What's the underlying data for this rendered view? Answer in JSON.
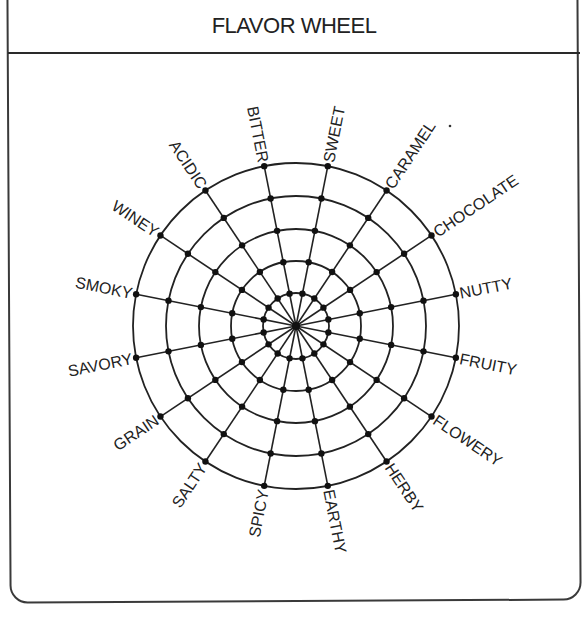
{
  "header": {
    "title": "FLAVOR WHEEL"
  },
  "wheel": {
    "center": [
      296,
      326
    ],
    "ring_radii": [
      33,
      65,
      97,
      130,
      163
    ],
    "line_color": "#222222",
    "spokes": [
      {
        "label": "NUTTY",
        "angle": 11.25
      },
      {
        "label": "CHOCOLATE",
        "angle": 33.75
      },
      {
        "label": "CARAMEL",
        "angle": 56.25
      },
      {
        "label": "SWEET",
        "angle": 78.75
      },
      {
        "label": "BITTER",
        "angle": 101.25
      },
      {
        "label": "ACIDIC",
        "angle": 123.75
      },
      {
        "label": "WINEY",
        "angle": 146.25
      },
      {
        "label": "SMOKY",
        "angle": 168.75
      },
      {
        "label": "SAVORY",
        "angle": 191.25
      },
      {
        "label": "GRAIN",
        "angle": 213.75
      },
      {
        "label": "SALTY",
        "angle": 236.25
      },
      {
        "label": "SPICY",
        "angle": 258.75
      },
      {
        "label": "EARTHY",
        "angle": 281.25
      },
      {
        "label": "HERBY",
        "angle": 303.75
      },
      {
        "label": "FLOWERY",
        "angle": 326.25
      },
      {
        "label": "FRUITY",
        "angle": 348.75
      }
    ],
    "stray_mark": [
      450,
      126
    ]
  }
}
